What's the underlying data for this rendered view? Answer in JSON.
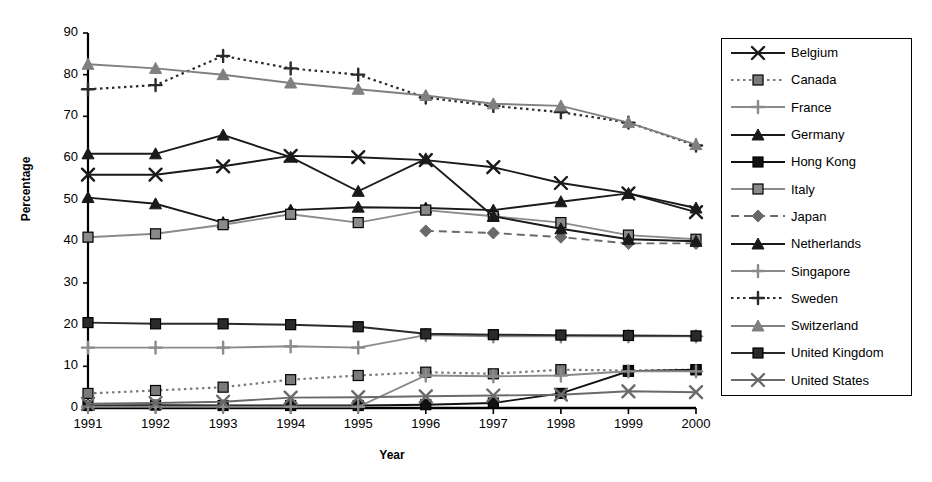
{
  "chart_data": {
    "type": "line",
    "title": "",
    "xlabel": "Year",
    "ylabel": "Percentage",
    "categories": [
      "1991",
      "1992",
      "1993",
      "1994",
      "1995",
      "1996",
      "1997",
      "1998",
      "1999",
      "2000"
    ],
    "x": [
      1991,
      1992,
      1993,
      1994,
      1995,
      1996,
      1997,
      1998,
      1999,
      2000
    ],
    "xlim": [
      1991,
      2000
    ],
    "ylim": [
      0,
      90
    ],
    "yticks": [
      0,
      10,
      20,
      30,
      40,
      50,
      60,
      70,
      80,
      90
    ],
    "grid": false,
    "legend_position": "right",
    "series": [
      {
        "name": "Belgium",
        "marker": "x",
        "line": "solid",
        "color": "#1a1a1a",
        "values": [
          56.0,
          56.0,
          58.0,
          60.5,
          60.2,
          59.5,
          57.8,
          54.0,
          51.5,
          47.0
        ]
      },
      {
        "name": "Canada",
        "marker": "square",
        "line": "dotted",
        "color": "#7a7a7a",
        "values": [
          3.5,
          4.2,
          5.0,
          6.8,
          7.8,
          8.6,
          8.2,
          9.2,
          9.0,
          9.2
        ]
      },
      {
        "name": "France",
        "marker": "plus",
        "line": "solid",
        "color": "#8a8a8a",
        "values": [
          14.5,
          14.5,
          14.5,
          14.8,
          14.5,
          17.5,
          17.2,
          17.2,
          17.2,
          17.2
        ]
      },
      {
        "name": "Germany",
        "marker": "triangle",
        "line": "solid",
        "color": "#1a1a1a",
        "values": [
          50.5,
          49.0,
          44.5,
          47.5,
          48.2,
          48.0,
          47.5,
          49.5,
          51.5,
          48.0
        ]
      },
      {
        "name": "Hong Kong",
        "marker": "square",
        "line": "solid",
        "color": "#111111",
        "values": [
          0.6,
          0.7,
          0.6,
          0.6,
          0.6,
          0.8,
          1.2,
          3.5,
          8.8,
          9.2
        ]
      },
      {
        "name": "Italy",
        "marker": "square",
        "line": "solid",
        "color": "#8a8a8a",
        "values": [
          41.0,
          41.8,
          44.0,
          46.5,
          44.5,
          47.5,
          46.0,
          44.5,
          41.5,
          40.5
        ]
      },
      {
        "name": "Japan",
        "marker": "diamond",
        "line": "dashed",
        "color": "#6a6a6a",
        "values": [
          null,
          null,
          null,
          null,
          null,
          42.5,
          42.0,
          41.0,
          39.5,
          39.5
        ]
      },
      {
        "name": "Netherlands",
        "marker": "triangle",
        "line": "solid",
        "color": "#1a1a1a",
        "values": [
          61.0,
          61.0,
          65.5,
          60.2,
          52.0,
          59.8,
          46.0,
          43.0,
          40.5,
          40.0
        ]
      },
      {
        "name": "Singapore",
        "marker": "plus",
        "line": "solid",
        "color": "#8a8a8a",
        "values": [
          0.3,
          0.3,
          0.3,
          0.3,
          0.3,
          7.8,
          7.6,
          7.8,
          8.8,
          8.8
        ]
      },
      {
        "name": "Sweden",
        "marker": "plus",
        "line": "dotted",
        "color": "#2a2a2a",
        "values": [
          76.5,
          77.5,
          84.5,
          81.5,
          80.0,
          74.5,
          72.5,
          71.0,
          68.5,
          63.0
        ]
      },
      {
        "name": "Switzerland",
        "marker": "triangle",
        "line": "solid",
        "color": "#808080",
        "values": [
          82.5,
          81.5,
          80.0,
          78.0,
          76.5,
          75.0,
          73.0,
          72.5,
          68.5,
          63.2
        ]
      },
      {
        "name": "United Kingdom",
        "marker": "square",
        "line": "solid",
        "color": "#2a2a2a",
        "values": [
          20.5,
          20.2,
          20.2,
          20.0,
          19.5,
          17.8,
          17.6,
          17.5,
          17.4,
          17.3
        ]
      },
      {
        "name": "United States",
        "marker": "x",
        "line": "solid",
        "color": "#6a6a6a",
        "values": [
          1.0,
          1.2,
          1.5,
          2.5,
          2.6,
          2.8,
          3.0,
          3.2,
          4.0,
          3.8
        ]
      }
    ]
  },
  "legend": {
    "items": [
      {
        "label": "Belgium"
      },
      {
        "label": "Canada"
      },
      {
        "label": "France"
      },
      {
        "label": "Germany"
      },
      {
        "label": "Hong Kong"
      },
      {
        "label": "Italy"
      },
      {
        "label": "Japan"
      },
      {
        "label": "Netherlands"
      },
      {
        "label": "Singapore"
      },
      {
        "label": "Sweden"
      },
      {
        "label": "Switzerland"
      },
      {
        "label": "United Kingdom"
      },
      {
        "label": "United States"
      }
    ]
  }
}
